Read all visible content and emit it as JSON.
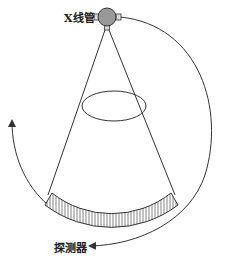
{
  "diagram": {
    "title": "",
    "labels": {
      "xray_tube": "X线管",
      "detector": "探测器"
    },
    "colors": {
      "stroke": "#333333",
      "tube_fill": "#999999",
      "background": "#ffffff"
    },
    "components": [
      {
        "id": "xray-tube",
        "label": "X线管",
        "shape": "circle"
      },
      {
        "id": "beam-cone",
        "shape": "fan"
      },
      {
        "id": "patient-ellipse",
        "shape": "ellipse"
      },
      {
        "id": "detector-array",
        "label": "探测器",
        "shape": "arc-band"
      },
      {
        "id": "rotation-arrow-right",
        "shape": "arc-arrow"
      },
      {
        "id": "rotation-arrow-left",
        "shape": "arc-arrow"
      }
    ]
  }
}
